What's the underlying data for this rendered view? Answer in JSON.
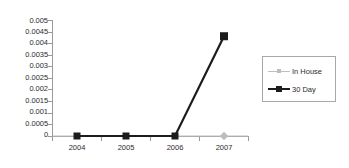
{
  "chart_data": {
    "type": "line",
    "title": "",
    "subtitle": "",
    "xlabel": "",
    "ylabel": "",
    "categories": [
      "2004",
      "2005",
      "2006",
      "2007"
    ],
    "x": [
      2004,
      2005,
      2006,
      2007
    ],
    "ylim": [
      0,
      0.005
    ],
    "xlim": [
      2003.6,
      2007.6
    ],
    "y_ticks": [
      0.005,
      0.0045,
      0.004,
      0.0035,
      0.003,
      0.0025,
      0.002,
      0.0015,
      0.001,
      0.0005,
      0
    ],
    "y_tick_labels": [
      "0.005",
      "0.0045",
      "0.004",
      "0.0035",
      "0.003",
      "0.0025",
      "0.002",
      "0.0015",
      "0.001",
      "0.0005",
      "0"
    ],
    "x_tick_labels": [
      "2004",
      "2005",
      "2006",
      "2007"
    ],
    "grid": false,
    "legend_position": "right",
    "series": [
      {
        "name": "In House",
        "color": "#bfbfbf",
        "marker": "diamond",
        "values": [
          0,
          0,
          0,
          0
        ]
      },
      {
        "name": "30 Day",
        "color": "#1c1c1c",
        "marker": "square",
        "values": [
          0,
          0,
          0,
          0.0043
        ]
      }
    ]
  },
  "axes": {
    "y_labels": [
      "0.005",
      "0.0045",
      "0.004",
      "0.0035",
      "0.003",
      "0.0025",
      "0.002",
      "0.0015",
      "0.001",
      "0.0005",
      "0"
    ],
    "x_labels": [
      "2004",
      "2005",
      "2006",
      "2007"
    ]
  },
  "legend": {
    "entries": [
      {
        "label": "In House",
        "color": "#bfbfbf"
      },
      {
        "label": "30 Day",
        "color": "#1c1c1c"
      }
    ]
  },
  "colors": {
    "in_house": "#bfbfbf",
    "thirty_day": "#1c1c1c",
    "axis": "#9a9a9a",
    "text": "#2b2b2b",
    "background": "#ffffff"
  }
}
